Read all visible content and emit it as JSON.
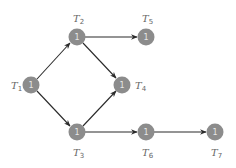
{
  "diagram": {
    "type": "task-dependency-graph",
    "colors": {
      "node_fill": "#8c8c8c",
      "node_text": "#e6e6e6",
      "edge": "#2a2a2a",
      "label": "#666666"
    },
    "nodes": [
      {
        "id": "T1",
        "label_main": "T",
        "label_sub": "1",
        "value": "1",
        "x": 31,
        "y": 85,
        "label_pos": "left"
      },
      {
        "id": "T2",
        "label_main": "T",
        "label_sub": "2",
        "value": "1",
        "x": 77,
        "y": 37,
        "label_pos": "top"
      },
      {
        "id": "T3",
        "label_main": "T",
        "label_sub": "3",
        "value": "1",
        "x": 77,
        "y": 132,
        "label_pos": "bottom"
      },
      {
        "id": "T4",
        "label_main": "T",
        "label_sub": "4",
        "value": "1",
        "x": 122,
        "y": 85,
        "label_pos": "right"
      },
      {
        "id": "T5",
        "label_main": "T",
        "label_sub": "5",
        "value": "1",
        "x": 146,
        "y": 37,
        "label_pos": "top"
      },
      {
        "id": "T6",
        "label_main": "T",
        "label_sub": "6",
        "value": "1",
        "x": 146,
        "y": 132,
        "label_pos": "bottom"
      },
      {
        "id": "T7",
        "label_main": "T",
        "label_sub": "7",
        "value": "1",
        "x": 215,
        "y": 132,
        "label_pos": "bottom"
      }
    ],
    "edges": [
      {
        "from": "T1",
        "to": "T2"
      },
      {
        "from": "T1",
        "to": "T3"
      },
      {
        "from": "T2",
        "to": "T5"
      },
      {
        "from": "T2",
        "to": "T4"
      },
      {
        "from": "T3",
        "to": "T4"
      },
      {
        "from": "T3",
        "to": "T6"
      },
      {
        "from": "T6",
        "to": "T7"
      }
    ]
  }
}
